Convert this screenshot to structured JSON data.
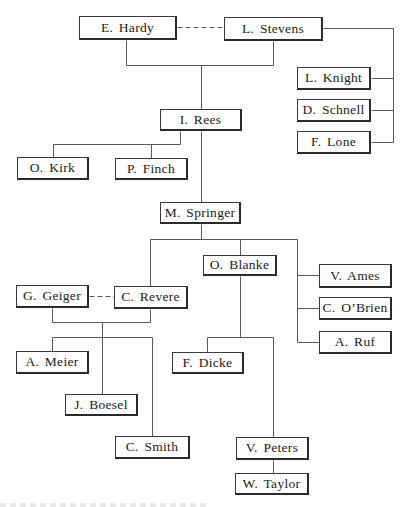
{
  "diagram": {
    "type": "organizational-chart",
    "nodes": [
      {
        "id": "hardy",
        "label": "E. Hardy",
        "x": 79,
        "y": 16,
        "w": 98,
        "h": 24
      },
      {
        "id": "stevens",
        "label": "L. Stevens",
        "x": 224,
        "y": 17,
        "w": 99,
        "h": 24
      },
      {
        "id": "knight",
        "label": "L. Knight",
        "x": 297,
        "y": 67,
        "w": 74,
        "h": 23
      },
      {
        "id": "schnell",
        "label": "D. Schnell",
        "x": 297,
        "y": 99,
        "w": 74,
        "h": 23
      },
      {
        "id": "lone",
        "label": "F. Lone",
        "x": 297,
        "y": 131,
        "w": 74,
        "h": 23
      },
      {
        "id": "rees",
        "label": "I. Rees",
        "x": 160,
        "y": 109,
        "w": 82,
        "h": 22
      },
      {
        "id": "kirk",
        "label": "O. Kirk",
        "x": 17,
        "y": 157,
        "w": 72,
        "h": 23
      },
      {
        "id": "finch",
        "label": "P. Finch",
        "x": 115,
        "y": 158,
        "w": 73,
        "h": 22
      },
      {
        "id": "springer",
        "label": "M. Springer",
        "x": 160,
        "y": 202,
        "w": 81,
        "h": 22
      },
      {
        "id": "blanke",
        "label": "O. Blanke",
        "x": 203,
        "y": 255,
        "w": 74,
        "h": 21
      },
      {
        "id": "ames",
        "label": "V. Ames",
        "x": 319,
        "y": 264,
        "w": 73,
        "h": 24
      },
      {
        "id": "obrien",
        "label": "C. O’Brien",
        "x": 319,
        "y": 297,
        "w": 73,
        "h": 23
      },
      {
        "id": "ruf",
        "label": "A. Ruf",
        "x": 319,
        "y": 331,
        "w": 73,
        "h": 23
      },
      {
        "id": "geiger",
        "label": "G. Geiger",
        "x": 16,
        "y": 285,
        "w": 73,
        "h": 23
      },
      {
        "id": "revere",
        "label": "C. Revere",
        "x": 114,
        "y": 286,
        "w": 74,
        "h": 23
      },
      {
        "id": "meier",
        "label": "A. Meier",
        "x": 16,
        "y": 351,
        "w": 73,
        "h": 23
      },
      {
        "id": "dicke",
        "label": "F. Dicke",
        "x": 172,
        "y": 352,
        "w": 72,
        "h": 22
      },
      {
        "id": "boesel",
        "label": "J. Boesel",
        "x": 65,
        "y": 394,
        "w": 73,
        "h": 22
      },
      {
        "id": "smith",
        "label": "C. Smith",
        "x": 115,
        "y": 436,
        "w": 75,
        "h": 23
      },
      {
        "id": "peters",
        "label": "V. Peters",
        "x": 236,
        "y": 437,
        "w": 73,
        "h": 23
      },
      {
        "id": "taylor",
        "label": "W. Taylor",
        "x": 235,
        "y": 473,
        "w": 74,
        "h": 22
      }
    ],
    "links": [
      {
        "id": "hardy-stevens-dashed",
        "style": "dashed",
        "points": [
          [
            177,
            27
          ],
          [
            224,
            27
          ]
        ]
      },
      {
        "id": "hardy-down",
        "style": "solid",
        "points": [
          [
            126,
            40
          ],
          [
            126,
            65
          ],
          [
            273,
            65
          ],
          [
            273,
            41
          ]
        ]
      },
      {
        "id": "pair-to-rees",
        "style": "solid",
        "points": [
          [
            201,
            65
          ],
          [
            201,
            109
          ]
        ]
      },
      {
        "id": "stevens-right",
        "style": "solid",
        "points": [
          [
            323,
            28
          ],
          [
            393,
            28
          ],
          [
            393,
            142
          ]
        ]
      },
      {
        "id": "to-knight",
        "style": "solid",
        "points": [
          [
            371,
            78
          ],
          [
            393,
            78
          ]
        ]
      },
      {
        "id": "to-schnell",
        "style": "solid",
        "points": [
          [
            371,
            110
          ],
          [
            393,
            110
          ]
        ]
      },
      {
        "id": "to-lone",
        "style": "solid",
        "points": [
          [
            371,
            142
          ],
          [
            393,
            142
          ]
        ]
      },
      {
        "id": "rees-left",
        "style": "solid",
        "points": [
          [
            180,
            131
          ],
          [
            180,
            144
          ],
          [
            53,
            144
          ],
          [
            53,
            157
          ]
        ]
      },
      {
        "id": "to-finch",
        "style": "solid",
        "points": [
          [
            151,
            144
          ],
          [
            151,
            158
          ]
        ]
      },
      {
        "id": "rees-to-springer",
        "style": "solid",
        "points": [
          [
            201,
            131
          ],
          [
            201,
            202
          ]
        ]
      },
      {
        "id": "springer-down",
        "style": "solid",
        "points": [
          [
            201,
            224
          ],
          [
            201,
            239
          ]
        ]
      },
      {
        "id": "springer-bus",
        "style": "solid",
        "points": [
          [
            150,
            286
          ],
          [
            150,
            239
          ],
          [
            297,
            239
          ],
          [
            297,
            342
          ]
        ]
      },
      {
        "id": "to-blanke",
        "style": "solid",
        "points": [
          [
            240,
            239
          ],
          [
            240,
            255
          ]
        ]
      },
      {
        "id": "to-ames",
        "style": "solid",
        "points": [
          [
            297,
            275
          ],
          [
            319,
            275
          ]
        ]
      },
      {
        "id": "to-obrien",
        "style": "solid",
        "points": [
          [
            297,
            308
          ],
          [
            319,
            308
          ]
        ]
      },
      {
        "id": "to-ruf",
        "style": "solid",
        "points": [
          [
            297,
            342
          ],
          [
            319,
            342
          ]
        ]
      },
      {
        "id": "geiger-revere-dashed",
        "style": "dashed",
        "points": [
          [
            89,
            296
          ],
          [
            114,
            296
          ]
        ]
      },
      {
        "id": "pair2-join",
        "style": "solid",
        "points": [
          [
            52,
            308
          ],
          [
            52,
            322
          ],
          [
            150,
            322
          ],
          [
            150,
            309
          ]
        ]
      },
      {
        "id": "pair2-stem",
        "style": "solid",
        "points": [
          [
            102,
            322
          ],
          [
            102,
            394
          ]
        ]
      },
      {
        "id": "pair2-bus",
        "style": "solid",
        "points": [
          [
            52,
            351
          ],
          [
            52,
            337
          ],
          [
            152,
            337
          ],
          [
            152,
            436
          ]
        ]
      },
      {
        "id": "blanke-down",
        "style": "solid",
        "points": [
          [
            240,
            276
          ],
          [
            240,
            337
          ]
        ]
      },
      {
        "id": "blanke-bus",
        "style": "solid",
        "points": [
          [
            207,
            352
          ],
          [
            207,
            337
          ],
          [
            273,
            337
          ],
          [
            273,
            437
          ]
        ]
      },
      {
        "id": "peters-taylor",
        "style": "solid",
        "points": [
          [
            273,
            460
          ],
          [
            273,
            473
          ]
        ]
      }
    ],
    "colors": {
      "line": "#5a5a5a",
      "border": "#2a2a2a",
      "text": "#222222",
      "background": "#ffffff"
    }
  }
}
